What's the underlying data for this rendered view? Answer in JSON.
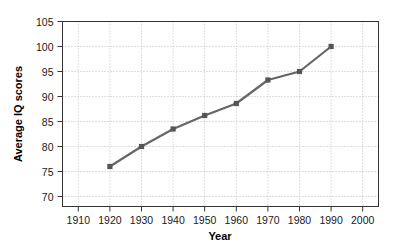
{
  "chart_data": {
    "type": "line",
    "title": "",
    "xlabel": "Year",
    "ylabel": "Average IQ scores",
    "xlim": [
      1905,
      2005
    ],
    "ylim": [
      68,
      105
    ],
    "grid": true,
    "legend": "none",
    "x": [
      1920,
      1930,
      1940,
      1950,
      1960,
      1970,
      1980,
      1990
    ],
    "values": [
      76,
      80,
      83.5,
      86.2,
      88.6,
      93.3,
      95,
      100
    ],
    "series": [
      {
        "name": "Average IQ scores",
        "x": [
          1920,
          1930,
          1940,
          1950,
          1960,
          1970,
          1980,
          1990
        ],
        "values": [
          76,
          80,
          83.5,
          86.2,
          88.6,
          93.3,
          95,
          100
        ]
      }
    ],
    "x_ticks": [
      1910,
      1920,
      1930,
      1940,
      1950,
      1960,
      1970,
      1980,
      1990,
      2000
    ],
    "x_tick_labels": [
      "1910",
      "1920",
      "1930",
      "1940",
      "1950",
      "1960",
      "1970",
      "1980",
      "1990",
      "2000"
    ],
    "y_ticks": [
      70,
      75,
      80,
      85,
      90,
      95,
      100,
      105
    ],
    "y_tick_labels": [
      "70",
      "75",
      "80",
      "85",
      "90",
      "95",
      "100",
      "105"
    ],
    "line_color": "#666666",
    "marker_color": "#555555",
    "marker_shape": "square",
    "grid_color": "#bdbdbd",
    "axis_color": "#333333",
    "background_color": "#ffffff"
  }
}
